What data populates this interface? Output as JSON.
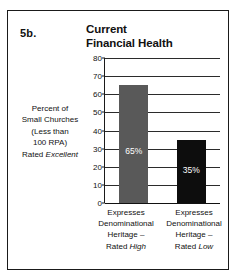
{
  "figure": {
    "number": "5b.",
    "title_line_1": "Current",
    "title_line_2": "Financial Health"
  },
  "y_caption": {
    "line_1": "Percent of",
    "line_2": "Small Churches",
    "line_3": "(Less than",
    "line_4": "100 RPA)",
    "line_5_prefix": "Rated ",
    "line_5_emphasis": "Excellent"
  },
  "categories_text": [
    {
      "line_1": "Expresses",
      "line_2": "Denominational",
      "line_3": "Heritage –",
      "line_4_prefix": "Rated ",
      "line_4_emphasis": "High"
    },
    {
      "line_1": "Expresses",
      "line_2": "Denominational",
      "line_3": "Heritage –",
      "line_4_prefix": "Rated ",
      "line_4_emphasis": "Low"
    }
  ],
  "bar_labels": {
    "bar_0": "65%",
    "bar_1": "35%"
  },
  "colors": {
    "bar_high": "#595959",
    "bar_low": "#0d0d0d",
    "frame": "#1a1a1a",
    "text": "#111111",
    "value_text": "#ffffff",
    "gridline": "#2b2b2b",
    "background": "#ffffff"
  },
  "chart_data": {
    "type": "bar",
    "title": "Current Financial Health",
    "xlabel": "",
    "ylabel": "Percent of Small Churches (Less than 100 RPA) Rated Excellent",
    "ylim": [
      0,
      80
    ],
    "yticks": [
      0,
      10,
      20,
      30,
      40,
      50,
      60,
      70,
      80
    ],
    "ytick_labels": [
      "0",
      "10",
      "20",
      "30",
      "40",
      "50",
      "60",
      "70",
      "80"
    ],
    "grid": true,
    "legend": false,
    "categories": [
      "Expresses Denominational Heritage – Rated High",
      "Expresses Denominational Heritage – Rated Low"
    ],
    "values": [
      65,
      35
    ],
    "data_labels": [
      "65%",
      "35%"
    ],
    "bar_colors": [
      "#595959",
      "#0d0d0d"
    ]
  }
}
